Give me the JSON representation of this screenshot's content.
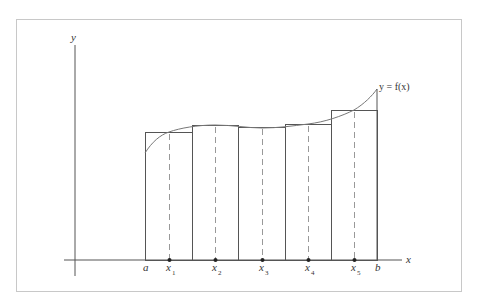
{
  "diagram": {
    "colors": {
      "frame": "#c8c8c8",
      "axis": "#555555",
      "rect": "#555555",
      "curve": "#777777",
      "dashed": "#999999",
      "point": "#222222",
      "text": "#333333"
    },
    "axes": {
      "x_label": "x",
      "y_label": "y"
    },
    "curve_label": "y  =  f(x)",
    "interval": {
      "a_label": "a",
      "b_label": "b"
    },
    "rectangles": [
      {
        "x0": 145,
        "x1": 192,
        "top": 132
      },
      {
        "x0": 192,
        "x1": 238,
        "top": 125
      },
      {
        "x0": 238,
        "x1": 285,
        "top": 127
      },
      {
        "x0": 285,
        "x1": 331,
        "top": 124
      },
      {
        "x0": 331,
        "x1": 377,
        "top": 110
      }
    ],
    "sample_points": [
      {
        "label": "x",
        "sub": "1",
        "x": 169
      },
      {
        "label": "x",
        "sub": "2",
        "x": 215
      },
      {
        "label": "x",
        "sub": "3",
        "x": 262
      },
      {
        "label": "x",
        "sub": "4",
        "x": 308
      },
      {
        "label": "x",
        "sub": "5",
        "x": 354
      }
    ]
  }
}
